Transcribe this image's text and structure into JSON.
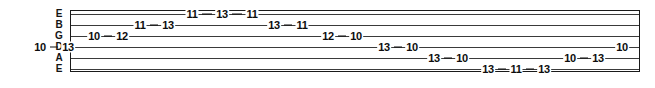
{
  "notation": {
    "type": "guitar-tablature",
    "staff": {
      "string_count": 6,
      "left": 70,
      "right": 640,
      "top": 10,
      "bottom": 72,
      "line_color": "#3a3a3a",
      "frame_color": "#1a1a1a",
      "text_color": "#0d0d0d",
      "background": "#ffffff"
    },
    "strings": [
      {
        "index": 0,
        "label": "E",
        "name": "high-e-string",
        "y": 14,
        "notes": [
          {
            "fret": "11",
            "x": 192
          },
          {
            "fret": "13",
            "x": 222
          },
          {
            "fret": "11",
            "x": 252
          }
        ],
        "runs": [
          [
            0,
            1,
            2
          ]
        ]
      },
      {
        "index": 1,
        "label": "B",
        "name": "b-string",
        "y": 25,
        "notes": [
          {
            "fret": "11",
            "x": 140
          },
          {
            "fret": "13",
            "x": 168
          },
          {
            "fret": "13",
            "x": 274
          },
          {
            "fret": "11",
            "x": 302
          }
        ],
        "runs": [
          [
            0,
            1
          ],
          [
            2,
            3
          ]
        ]
      },
      {
        "index": 2,
        "label": "G",
        "name": "g-string",
        "y": 36,
        "notes": [
          {
            "fret": "10",
            "x": 94
          },
          {
            "fret": "12",
            "x": 122
          },
          {
            "fret": "12",
            "x": 328
          },
          {
            "fret": "10",
            "x": 356
          }
        ],
        "runs": [
          [
            0,
            1
          ],
          [
            2,
            3
          ]
        ]
      },
      {
        "index": 3,
        "label": "D",
        "name": "d-string",
        "y": 47,
        "notes": [
          {
            "fret": "10",
            "x": 40
          },
          {
            "fret": "13",
            "x": 68
          },
          {
            "fret": "13",
            "x": 384
          },
          {
            "fret": "10",
            "x": 412
          },
          {
            "fret": "10",
            "x": 622
          }
        ],
        "runs": [
          [
            0,
            1
          ],
          [
            2,
            3
          ]
        ]
      },
      {
        "index": 4,
        "label": "A",
        "name": "a-string",
        "y": 58,
        "notes": [
          {
            "fret": "13",
            "x": 434
          },
          {
            "fret": "10",
            "x": 462
          },
          {
            "fret": "10",
            "x": 570
          },
          {
            "fret": "13",
            "x": 598
          }
        ],
        "runs": [
          [
            0,
            1
          ],
          [
            2,
            3
          ]
        ]
      },
      {
        "index": 5,
        "label": "E",
        "name": "low-e-string",
        "y": 69,
        "notes": [
          {
            "fret": "13",
            "x": 488
          },
          {
            "fret": "11",
            "x": 516
          },
          {
            "fret": "13",
            "x": 544
          }
        ],
        "runs": [
          [
            0,
            1,
            2
          ]
        ]
      }
    ]
  }
}
